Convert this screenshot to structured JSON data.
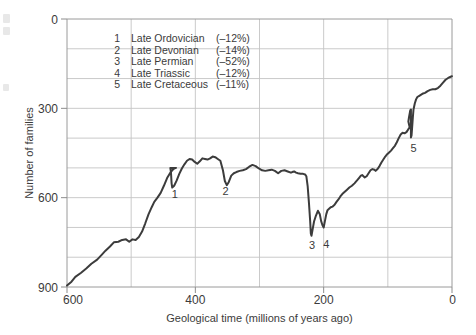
{
  "chart_data": {
    "type": "line",
    "title": "",
    "xlabel": "Geological time (millions of years ago)",
    "ylabel": "Number of families",
    "xlim": [
      600,
      0
    ],
    "ylim": [
      0,
      900
    ],
    "x_ticks": [
      600,
      400,
      200,
      0
    ],
    "y_ticks": [
      0,
      300,
      600,
      900
    ],
    "x_gridlines": [
      600,
      500,
      400,
      300,
      200,
      100,
      0
    ],
    "y_gridlines": [
      0,
      100,
      200,
      300,
      400,
      500,
      600,
      700,
      800,
      900
    ],
    "x_axis_inverted": true,
    "grid": true,
    "legend_position": "upper-left-inside",
    "series": [
      {
        "name": "Number of marine animal families",
        "points": [
          [
            600,
            5
          ],
          [
            593,
            18
          ],
          [
            587,
            34
          ],
          [
            578,
            48
          ],
          [
            570,
            62
          ],
          [
            562,
            78
          ],
          [
            553,
            92
          ],
          [
            546,
            108
          ],
          [
            540,
            122
          ],
          [
            533,
            136
          ],
          [
            527,
            150
          ],
          [
            520,
            152
          ],
          [
            514,
            158
          ],
          [
            508,
            160
          ],
          [
            503,
            152
          ],
          [
            498,
            160
          ],
          [
            493,
            158
          ],
          [
            488,
            168
          ],
          [
            483,
            186
          ],
          [
            478,
            214
          ],
          [
            473,
            244
          ],
          [
            468,
            268
          ],
          [
            464,
            286
          ],
          [
            459,
            300
          ],
          [
            454,
            316
          ],
          [
            449,
            340
          ],
          [
            444,
            366
          ],
          [
            439,
            384
          ],
          [
            436,
            392
          ],
          [
            433,
            398
          ],
          [
            430,
            400
          ],
          [
            439,
            400
          ],
          [
            438,
            386
          ],
          [
            437,
            348
          ],
          [
            436,
            334
          ],
          [
            433,
            340
          ],
          [
            429,
            358
          ],
          [
            425,
            380
          ],
          [
            421,
            398
          ],
          [
            417,
            412
          ],
          [
            413,
            424
          ],
          [
            409,
            430
          ],
          [
            405,
            428
          ],
          [
            401,
            420
          ],
          [
            397,
            414
          ],
          [
            393,
            422
          ],
          [
            389,
            432
          ],
          [
            385,
            430
          ],
          [
            381,
            428
          ],
          [
            377,
            432
          ],
          [
            373,
            438
          ],
          [
            369,
            436
          ],
          [
            365,
            430
          ],
          [
            361,
            424
          ],
          [
            357,
            392
          ],
          [
            354,
            356
          ],
          [
            351,
            342
          ],
          [
            348,
            352
          ],
          [
            344,
            374
          ],
          [
            340,
            382
          ],
          [
            336,
            386
          ],
          [
            331,
            390
          ],
          [
            326,
            392
          ],
          [
            321,
            396
          ],
          [
            316,
            404
          ],
          [
            311,
            410
          ],
          [
            306,
            406
          ],
          [
            301,
            398
          ],
          [
            296,
            392
          ],
          [
            291,
            390
          ],
          [
            286,
            392
          ],
          [
            281,
            394
          ],
          [
            276,
            390
          ],
          [
            271,
            382
          ],
          [
            266,
            390
          ],
          [
            261,
            392
          ],
          [
            256,
            388
          ],
          [
            251,
            384
          ],
          [
            249,
            386
          ],
          [
            246,
            388
          ],
          [
            243,
            384
          ],
          [
            240,
            382
          ],
          [
            236,
            380
          ],
          [
            232,
            380
          ],
          [
            229,
            378
          ],
          [
            227,
            372
          ],
          [
            225,
            340
          ],
          [
            223,
            284
          ],
          [
            221,
            220
          ],
          [
            220,
            180
          ],
          [
            219,
            172
          ],
          [
            217,
            196
          ],
          [
            215,
            220
          ],
          [
            212,
            240
          ],
          [
            209,
            256
          ],
          [
            206,
            244
          ],
          [
            204,
            222
          ],
          [
            202,
            208
          ],
          [
            200,
            200
          ],
          [
            198,
            222
          ],
          [
            196,
            244
          ],
          [
            194,
            258
          ],
          [
            192,
            262
          ],
          [
            189,
            268
          ],
          [
            186,
            270
          ],
          [
            183,
            276
          ],
          [
            180,
            286
          ],
          [
            177,
            294
          ],
          [
            174,
            304
          ],
          [
            171,
            312
          ],
          [
            168,
            318
          ],
          [
            164,
            326
          ],
          [
            160,
            334
          ],
          [
            156,
            340
          ],
          [
            152,
            348
          ],
          [
            148,
            358
          ],
          [
            145,
            366
          ],
          [
            142,
            374
          ],
          [
            140,
            376
          ],
          [
            138,
            372
          ],
          [
            136,
            368
          ],
          [
            133,
            372
          ],
          [
            130,
            382
          ],
          [
            127,
            392
          ],
          [
            124,
            396
          ],
          [
            121,
            394
          ],
          [
            119,
            390
          ],
          [
            116,
            396
          ],
          [
            113,
            406
          ],
          [
            110,
            418
          ],
          [
            107,
            428
          ],
          [
            104,
            438
          ],
          [
            101,
            446
          ],
          [
            98,
            452
          ],
          [
            95,
            458
          ],
          [
            92,
            466
          ],
          [
            89,
            474
          ],
          [
            86,
            486
          ],
          [
            83,
            500
          ],
          [
            80,
            512
          ],
          [
            77,
            518
          ],
          [
            74,
            516
          ],
          [
            71,
            520
          ],
          [
            68,
            530
          ],
          [
            66,
            536
          ],
          [
            68,
            556
          ],
          [
            67,
            570
          ],
          [
            66,
            582
          ],
          [
            65,
            594
          ],
          [
            64,
            596
          ],
          [
            64,
            540
          ],
          [
            64,
            502
          ],
          [
            63,
            510
          ],
          [
            62,
            540
          ],
          [
            61,
            570
          ],
          [
            60,
            596
          ],
          [
            58,
            616
          ],
          [
            56,
            630
          ],
          [
            54,
            638
          ],
          [
            51,
            642
          ],
          [
            48,
            646
          ],
          [
            45,
            650
          ],
          [
            42,
            652
          ],
          [
            38,
            658
          ],
          [
            34,
            662
          ],
          [
            30,
            664
          ],
          [
            26,
            664
          ],
          [
            22,
            668
          ],
          [
            18,
            676
          ],
          [
            14,
            686
          ],
          [
            10,
            696
          ],
          [
            6,
            702
          ],
          [
            2,
            706
          ],
          [
            0,
            708
          ]
        ]
      }
    ],
    "annotations": [
      {
        "id": "1",
        "label": "1",
        "x": 432,
        "y": 300
      },
      {
        "id": "2",
        "label": "2",
        "x": 353,
        "y": 308
      },
      {
        "id": "3",
        "label": "3",
        "x": 218,
        "y": 128
      },
      {
        "id": "4",
        "label": "4",
        "x": 196,
        "y": 130
      },
      {
        "id": "5",
        "label": "5",
        "x": 60,
        "y": 452
      }
    ]
  },
  "axes": {
    "y_axis_title": "Number of families",
    "x_axis_title": "Geological time (millions of years ago)",
    "y_tick_labels": [
      "900",
      "600",
      "300",
      "0"
    ],
    "x_tick_labels": [
      "600",
      "400",
      "200",
      "0"
    ]
  },
  "legend": {
    "entries": [
      {
        "number": "1",
        "name": "Late Ordovician",
        "magnitude": "(–12%)"
      },
      {
        "number": "2",
        "name": "Late Devonian",
        "magnitude": "(–14%)"
      },
      {
        "number": "3",
        "name": "Late Permian",
        "magnitude": "(–52%)"
      },
      {
        "number": "4",
        "name": "Late Triassic",
        "magnitude": "(–12%)"
      },
      {
        "number": "5",
        "name": "Late Cretaceous",
        "magnitude": "(–11%)"
      }
    ]
  },
  "colors": {
    "curve": "#3c3c3c",
    "grid": "#c4c4c4",
    "axis": "#9a9a9a",
    "text": "#3b3b3b",
    "background": "#ffffff"
  }
}
